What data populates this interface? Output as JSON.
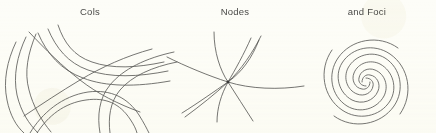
{
  "figure": {
    "background_color": "#fdfdf8",
    "ink_color": "#5d5d5b",
    "kind": "phase-portrait-types",
    "panels": [
      {
        "id": "cols",
        "label": "Cols",
        "icon_name": "saddle-point-phase-portrait",
        "description": "Saddle point (col): hyperbolic flow curves with two crossing separatrices",
        "curve_count": 11,
        "center": {
          "x": 63,
          "y": 62
        }
      },
      {
        "id": "nodes",
        "label": "Nodes",
        "icon_name": "node-phase-portrait",
        "description": "Node: five curves all passing through a single common equilibrium point",
        "curve_count": 5,
        "center": {
          "x": 63,
          "y": 62
        }
      },
      {
        "id": "foci",
        "label": "and Foci",
        "icon_name": "focus-spiral-phase-portrait",
        "description": "Focus: four logarithmic spiral arms winding into a central point",
        "curve_count": 4,
        "center": {
          "x": 68,
          "y": 62
        }
      }
    ]
  }
}
